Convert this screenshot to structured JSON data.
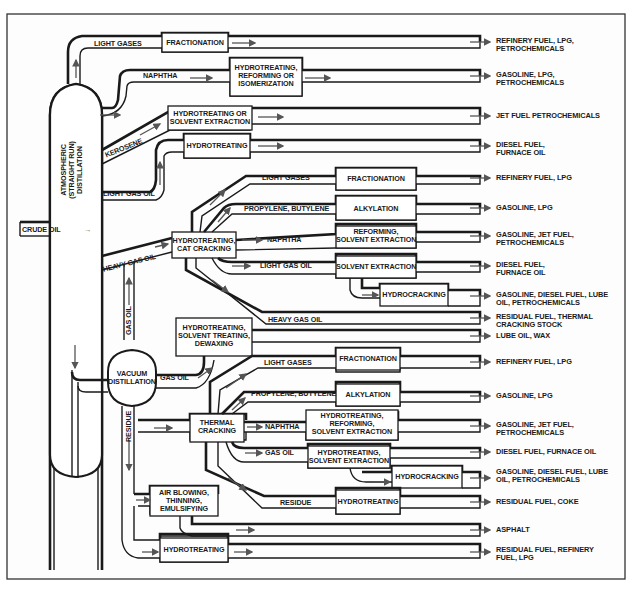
{
  "diagram": {
    "title": "",
    "colors": {
      "line": "#1a1a1a",
      "arrow": "#555555",
      "background": "#ffffff",
      "frame": "#333333"
    },
    "input": {
      "label": "CRUDE OIL"
    },
    "units": {
      "atmospheric": "ATMOSPHERIC\n(STRAIGHT RUN)\nDISTILLATION",
      "atmospheric_lines": [
        "ATMOSPHERIC",
        "(STRAIGHT RUN)",
        "DISTILLATION"
      ],
      "vacuum_lines": [
        "VACUUM",
        "DISTILLATION"
      ]
    },
    "streams": {
      "light_gases_1": "LIGHT GASES",
      "naphtha_1": "NAPHTHA",
      "kerosene": "KEROSENE",
      "light_gas_oil_1": "LIGHT GAS OIL",
      "heavy_gas_oil_1": "HEAVY GAS OIL",
      "gas_oil_up": "GAS OIL",
      "gas_oil_vac": "GAS OIL",
      "residue_vert": "RESIDUE",
      "light_gases_2": "LIGHT GASES",
      "propylene_butylene_1": "PROPYLENE, BUTYLENE",
      "naphtha_2": "NAPHTHA",
      "light_gas_oil_2": "LIGHT GAS OIL",
      "heavy_gas_oil_2": "HEAVY GAS OIL",
      "light_gases_3": "LIGHT GASES",
      "propylene_butylene_2": "PROPYLENE, BUTYLENE",
      "naphtha_3": "NAPHTHA",
      "gas_oil_3": "GAS OIL",
      "residue_3": "RESIDUE"
    },
    "processes": {
      "fractionation_1": "FRACTIONATION",
      "hrf_lines": [
        "HYDROTREATING,",
        "REFORMING OR",
        "ISOMERIZATION"
      ],
      "hse_lines": [
        "HYDROTREATING OR",
        "SOLVENT EXTRACTION"
      ],
      "hydrotreating_1": "HYDROTREATING",
      "htcc_lines": [
        "HYDROTREATING,",
        "CAT CRACKING"
      ],
      "fractionation_2": "FRACTIONATION",
      "alkylation_1": "ALKYLATION",
      "rse_lines": [
        "REFORMING,",
        "SOLVENT EXTRACTION"
      ],
      "solvent_extraction": "SOLVENT EXTRACTION",
      "hydrocracking_1": "HYDROCRACKING",
      "hstd_lines": [
        "HYDROTREATING,",
        "SOLVENT TREATING,",
        "DEWAXING"
      ],
      "thermal_lines": [
        "THERMAL",
        "CRACKING"
      ],
      "fractionation_3": "FRACTIONATION",
      "alkylation_2": "ALKYLATION",
      "hrse_lines": [
        "HYDROTREATING,",
        "REFORMING,",
        "SOLVENT EXTRACTION"
      ],
      "hse2_lines": [
        "HYDROTREATING,",
        "SOLVENT EXTRACTION"
      ],
      "hydrocracking_2": "HYDROCRACKING",
      "hydrotreating_2": "HYDROTREATING",
      "air_lines": [
        "AIR BLOWING,",
        "THINNING,",
        "EMULSIFYING"
      ],
      "hydrotreating_3": "HYDROTREATING"
    },
    "outputs": [
      {
        "lines": [
          "REFINERY FUEL, LPG,",
          "PETROCHEMICALS"
        ]
      },
      {
        "lines": [
          "GASOLINE, LPG,",
          "PETROCHEMICALS"
        ]
      },
      {
        "lines": [
          "JET FUEL PETROCHEMICALS"
        ]
      },
      {
        "lines": [
          "DIESEL FUEL,",
          "FURNACE OIL"
        ]
      },
      {
        "lines": [
          "REFINERY FUEL, LPG"
        ]
      },
      {
        "lines": [
          "GASOLINE, LPG"
        ]
      },
      {
        "lines": [
          "GASOLINE, JET FUEL,",
          "PETROCHEMICALS"
        ]
      },
      {
        "lines": [
          "DIESEL FUEL,",
          "FURNACE OIL"
        ]
      },
      {
        "lines": [
          "GASOLINE, DIESEL FUEL, LUBE",
          "OIL, PETROCHEMICALS"
        ]
      },
      {
        "lines": [
          "RESIDUAL FUEL, THERMAL",
          "CRACKING STOCK"
        ]
      },
      {
        "lines": [
          "LUBE OIL, WAX"
        ]
      },
      {
        "lines": [
          "REFINERY FUEL, LPG"
        ]
      },
      {
        "lines": [
          "GASOLINE, LPG"
        ]
      },
      {
        "lines": [
          "GASOLINE, JET FUEL,",
          "PETROCHEMICALS"
        ]
      },
      {
        "lines": [
          "DIESEL FUEL, FURNACE OIL"
        ]
      },
      {
        "lines": [
          "GASOLINE, DIESEL FUEL, LUBE",
          "OIL, PETROCHEMICALS"
        ]
      },
      {
        "lines": [
          "RESIDUAL FUEL, COKE"
        ]
      },
      {
        "lines": [
          "ASPHALT"
        ]
      },
      {
        "lines": [
          "RESIDUAL FUEL, REFINERY",
          "FUEL, LPG"
        ]
      }
    ]
  }
}
